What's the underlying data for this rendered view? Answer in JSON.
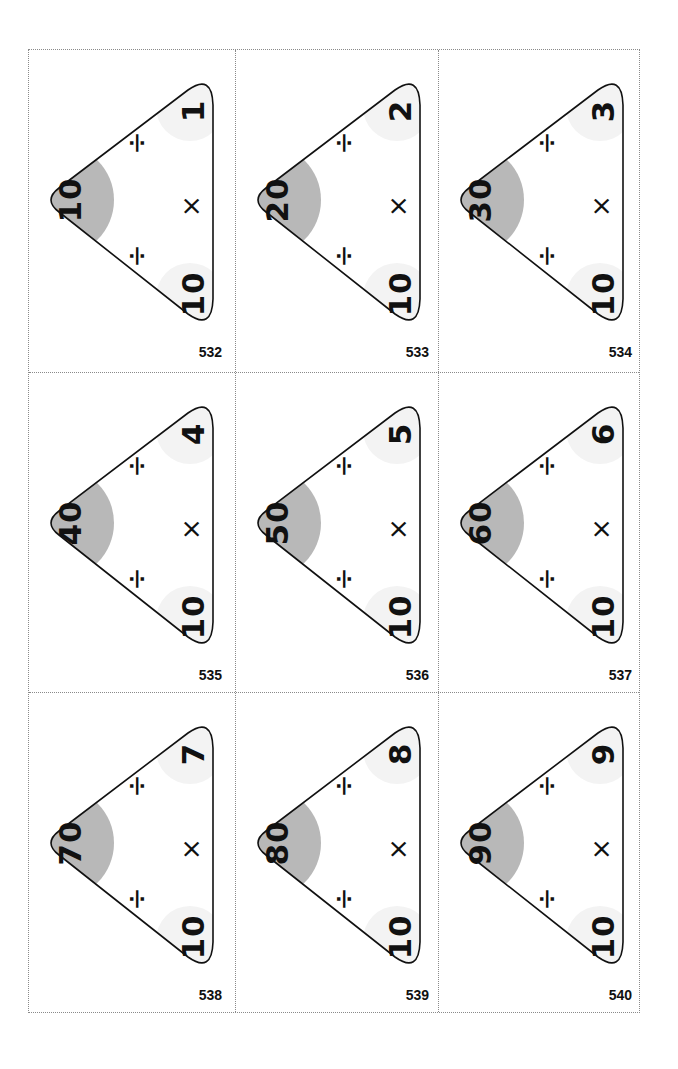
{
  "sheet": {
    "colors": {
      "apex_fill": "#b8b8b8",
      "corner_fill": "#f3f3f3",
      "outline": "#111111"
    },
    "operators": {
      "divide": "÷",
      "multiply": "×"
    },
    "cards": [
      {
        "id": "532",
        "top": "10",
        "left": "10",
        "right": "1"
      },
      {
        "id": "533",
        "top": "20",
        "left": "10",
        "right": "2"
      },
      {
        "id": "534",
        "top": "30",
        "left": "10",
        "right": "3"
      },
      {
        "id": "535",
        "top": "40",
        "left": "10",
        "right": "4"
      },
      {
        "id": "536",
        "top": "50",
        "left": "10",
        "right": "5"
      },
      {
        "id": "537",
        "top": "60",
        "left": "10",
        "right": "6"
      },
      {
        "id": "538",
        "top": "70",
        "left": "10",
        "right": "7"
      },
      {
        "id": "539",
        "top": "80",
        "left": "10",
        "right": "8"
      },
      {
        "id": "540",
        "top": "90",
        "left": "10",
        "right": "9"
      }
    ]
  }
}
